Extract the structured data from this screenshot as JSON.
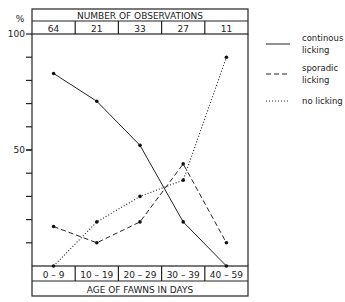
{
  "chart_data": {
    "type": "line",
    "title": "",
    "top_header": "NUMBER OF OBSERVATIONS",
    "observations": [
      "64",
      "21",
      "33",
      "27",
      "11"
    ],
    "categories": [
      "0 – 9",
      "10 – 19",
      "20 – 29",
      "30 – 39",
      "40 – 59"
    ],
    "xlabel": "AGE OF FAWNS IN DAYS",
    "ylabel": "%",
    "ylim": [
      0,
      100
    ],
    "yticks": [
      {
        "value": 100,
        "label": "100"
      },
      {
        "value": 50,
        "label": "50"
      }
    ],
    "minor_tick_step": 10,
    "series": [
      {
        "name": "continous licking",
        "legend_lines": [
          "continous",
          "licking"
        ],
        "style": "solid",
        "values": [
          83,
          71,
          52,
          19,
          0
        ]
      },
      {
        "name": "sporadic licking",
        "legend_lines": [
          "sporadic",
          "licking"
        ],
        "style": "dashed",
        "values": [
          17,
          10,
          19,
          44,
          10
        ]
      },
      {
        "name": "no licking",
        "legend_lines": [
          "no licking"
        ],
        "style": "dotted",
        "values": [
          0,
          19,
          30,
          37,
          90
        ]
      }
    ],
    "legend_position": "right"
  }
}
